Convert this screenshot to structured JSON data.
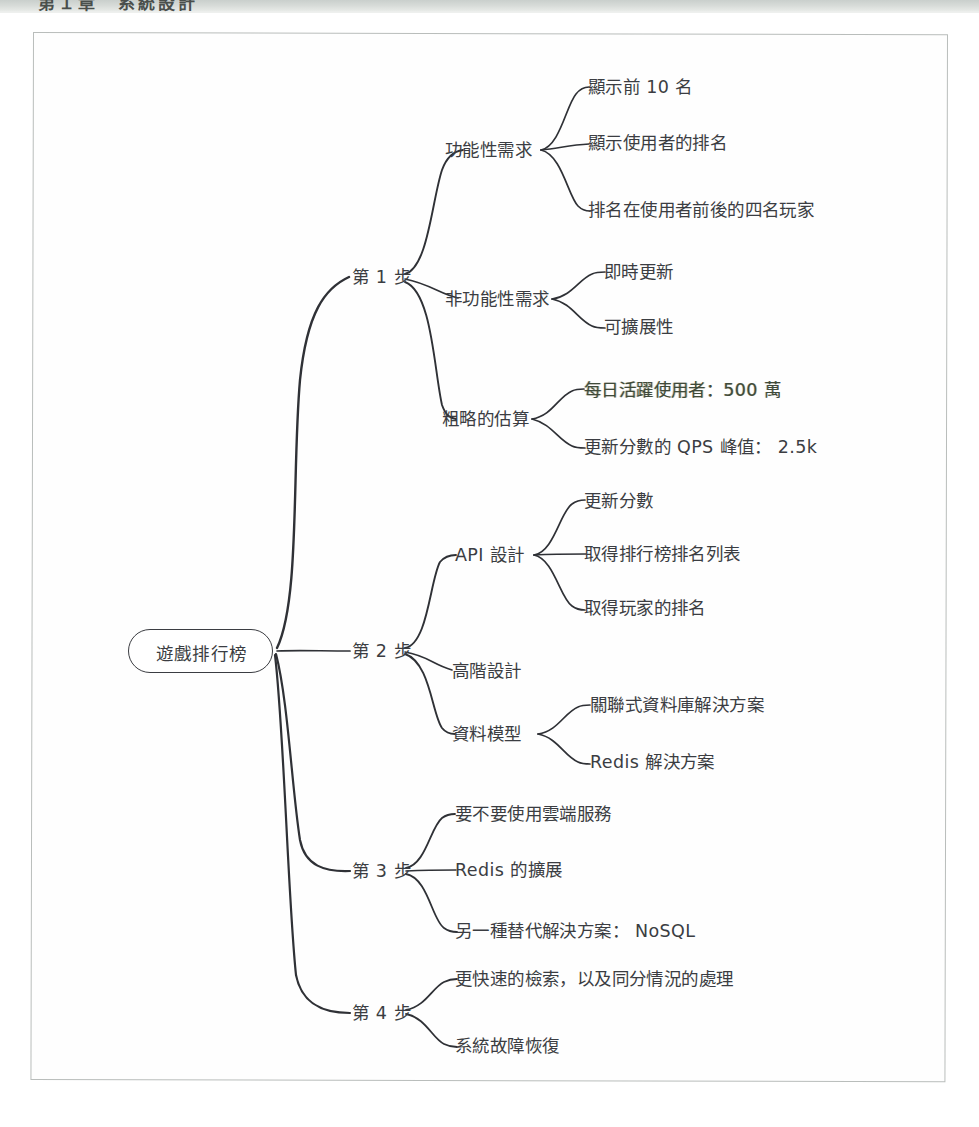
{
  "header_band": {
    "cut_off_text": "第１章　系統設計"
  },
  "diagram": {
    "type": "mindmap",
    "ink_color": "#3b3d42",
    "page_background": "#fefefe",
    "highlight_color": "#3f4a3a",
    "root": {
      "label": "遊戲排行榜",
      "x": 200,
      "y": 651
    },
    "branches": [
      {
        "label": "第 1 步",
        "x": 355,
        "y": 277,
        "children": [
          {
            "label": "功能性需求",
            "x": 492,
            "y": 150,
            "children": [
              {
                "label": "顯示前 10 名",
                "x": 637,
                "y": 87
              },
              {
                "label": "顯示使用者的排名",
                "x": 666,
                "y": 143
              },
              {
                "label": "排名在使用者前後的四名玩家",
                "x": 720,
                "y": 210
              }
            ]
          },
          {
            "label": "非功能性需求",
            "x": 492,
            "y": 300,
            "children": [
              {
                "label": "即時更新",
                "x": 648,
                "y": 273
              },
              {
                "label": "可擴展性",
                "x": 648,
                "y": 327
              }
            ]
          },
          {
            "label": "粗略的估算",
            "x": 485,
            "y": 419,
            "children": [
              {
                "label": "每日活躍使用者：500 萬",
                "x": 690,
                "y": 391,
                "tinted": true
              },
              {
                "label": "更新分數的 QPS 峰值： 2.5k",
                "x": 712,
                "y": 444
              }
            ]
          }
        ]
      },
      {
        "label": "第 2 步",
        "x": 355,
        "y": 651,
        "children": [
          {
            "label": "API 設計",
            "x": 482,
            "y": 555,
            "children": [
              {
                "label": "更新分數",
                "x": 618,
                "y": 502
              },
              {
                "label": "取得排行榜排名列表",
                "x": 670,
                "y": 555
              },
              {
                "label": "取得玩家的排名",
                "x": 650,
                "y": 608
              }
            ]
          },
          {
            "label": "高階設計",
            "x": 480,
            "y": 671,
            "children": []
          },
          {
            "label": "資料模型",
            "x": 480,
            "y": 734,
            "children": [
              {
                "label": "關聯式資料庫解決方案",
                "x": 684,
                "y": 706
              },
              {
                "label": "Redis 解決方案",
                "x": 650,
                "y": 760
              }
            ]
          }
        ]
      },
      {
        "label": "第 3 步",
        "x": 355,
        "y": 871,
        "children": [
          {
            "label": "要不要使用雲端服務",
            "x": 520,
            "y": 817
          },
          {
            "label": "Redis 的擴展",
            "x": 492,
            "y": 871
          },
          {
            "label": "另一種替代解決方案： NoSQL",
            "x": 560,
            "y": 928
          }
        ]
      },
      {
        "label": "第 4 步",
        "x": 355,
        "y": 1013,
        "children": [
          {
            "label": "更快速的檢索，以及同分情況的處理",
            "x": 592,
            "y": 985
          },
          {
            "label": "系統故障恢復",
            "x": 506,
            "y": 1042
          }
        ]
      }
    ]
  }
}
